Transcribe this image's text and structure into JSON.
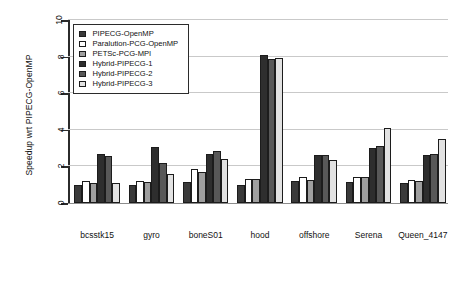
{
  "chart_data": {
    "type": "bar",
    "title": "",
    "xlabel": "",
    "ylabel": "Speedup wrt PIPECG-OpenMP",
    "ylim": [
      0,
      10
    ],
    "yticks": [
      0,
      2,
      4,
      6,
      8,
      10
    ],
    "grid": true,
    "legend_position": "top-left",
    "categories": [
      "bcsstk15",
      "gyro",
      "boneS01",
      "hood",
      "offshore",
      "Serena",
      "Queen_4147"
    ],
    "series": [
      {
        "name": "PIPECG-OpenMP",
        "color": "#3a3a3a",
        "values": [
          1.0,
          1.0,
          1.15,
          1.0,
          1.2,
          1.15,
          1.1
        ]
      },
      {
        "name": "Paralution-PCG-OpenMP",
        "color": "#ffffff",
        "values": [
          1.2,
          1.2,
          1.85,
          1.3,
          1.4,
          1.4,
          1.25
        ]
      },
      {
        "name": "PETSc-PCG-MPI",
        "color": "#9f9f9f",
        "values": [
          1.1,
          1.15,
          1.7,
          1.3,
          1.25,
          1.4,
          1.2
        ]
      },
      {
        "name": "Hybrid-PIPECG-1",
        "color": "#2e2e2e",
        "values": [
          2.7,
          3.05,
          2.7,
          8.1,
          2.6,
          3.0,
          2.6
        ]
      },
      {
        "name": "Hybrid-PIPECG-2",
        "color": "#585858",
        "values": [
          2.55,
          2.2,
          2.85,
          7.85,
          2.65,
          3.1,
          2.7
        ]
      },
      {
        "name": "Hybrid-PIPECG-3",
        "color": "#e2e2e2",
        "values": [
          1.1,
          1.6,
          2.4,
          7.95,
          2.35,
          4.1,
          3.5
        ]
      }
    ]
  },
  "yticks_labels": [
    "0",
    "2",
    "4",
    "6",
    "8",
    "10"
  ],
  "legend": {
    "items": [
      "PIPECG-OpenMP",
      "Paralution-PCG-OpenMP",
      "PETSc-PCG-MPI",
      "Hybrid-PIPECG-1",
      "Hybrid-PIPECG-2",
      "Hybrid-PIPECG-3"
    ]
  }
}
